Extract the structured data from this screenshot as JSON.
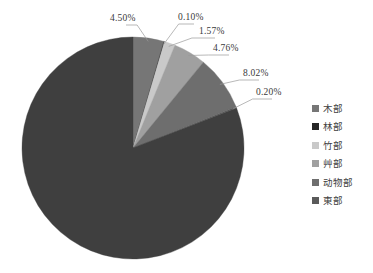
{
  "chart_data": {
    "type": "pie",
    "title": "",
    "categories": [
      "木部",
      "林部",
      "竹部",
      "艸部",
      "动物部",
      "東部",
      "其他"
    ],
    "values": [
      4.5,
      0.1,
      1.57,
      4.76,
      8.02,
      0.2,
      80.85
    ],
    "value_labels": [
      "4.50%",
      "0.10%",
      "1.57%",
      "4.76%",
      "8.02%",
      "0.20%",
      ""
    ],
    "colors": [
      "#767676",
      "#262626",
      "#c9c9c9",
      "#a0a0a0",
      "#6e6e6e",
      "#5a5a5a",
      "#3f3f3f"
    ],
    "units": "percent",
    "legend_position": "right",
    "start_angle": 0,
    "direction": "clockwise",
    "grid": false,
    "xlabel": "",
    "ylabel": ""
  },
  "labels": [
    {
      "text": "4.50%",
      "x": 110,
      "y": 14
    },
    {
      "text": "0.10%",
      "x": 178,
      "y": 13
    },
    {
      "text": "1.57%",
      "x": 199,
      "y": 27
    },
    {
      "text": "4.76%",
      "x": 213,
      "y": 44
    },
    {
      "text": "8.02%",
      "x": 243,
      "y": 69
    },
    {
      "text": "0.20%",
      "x": 256,
      "y": 88
    }
  ],
  "legend": {
    "items": [
      {
        "label": "木部",
        "color": "#767676"
      },
      {
        "label": "林部",
        "color": "#262626"
      },
      {
        "label": "竹部",
        "color": "#c9c9c9"
      },
      {
        "label": "艸部",
        "color": "#a0a0a0"
      },
      {
        "label": "动物部",
        "color": "#6e6e6e"
      },
      {
        "label": "東部",
        "color": "#5a5a5a"
      }
    ]
  },
  "geometry": {
    "center_x": 133,
    "center_y": 148,
    "radius": 111
  }
}
